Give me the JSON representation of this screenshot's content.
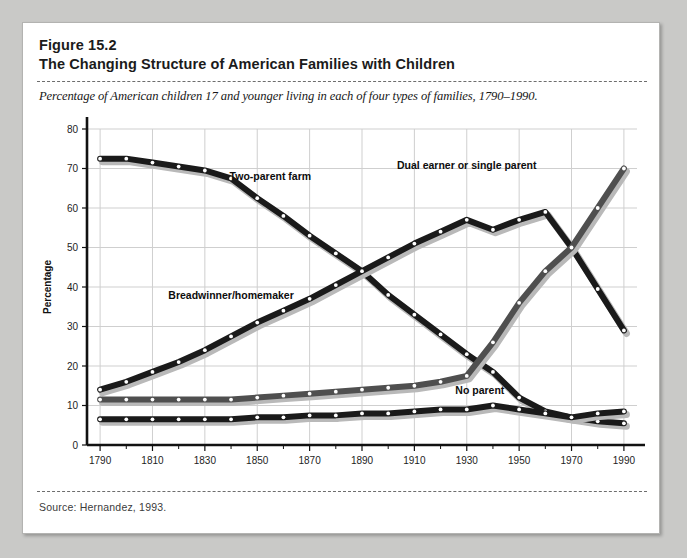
{
  "figure": {
    "number": "Figure 15.2",
    "title": "The Changing Structure of American Families with Children",
    "subtitle": "Percentage of American children 17 and younger living in each of four types of families, 1790–1990.",
    "source": "Source: Hernandez, 1993."
  },
  "colors": {
    "page_background": "#c9c9c7",
    "panel_background": "#ffffff",
    "panel_border": "#b3b3b1",
    "rule": "#6d6d6d",
    "grid": "#cfcfcf",
    "axis": "#111111",
    "series_dark": "#1a1a1a",
    "series_mid": "#4f4f4f",
    "series_shadow": "#b9b9b9",
    "marker_fill": "#ffffff"
  },
  "chart_data": {
    "type": "line",
    "title": "The Changing Structure of American Families with Children",
    "subtitle": "Percentage of American children 17 and younger living in each of four types of families, 1790–1990.",
    "xlabel": "",
    "ylabel": "Percentage",
    "xlim": [
      1785,
      1995
    ],
    "ylim": [
      0,
      80
    ],
    "yticks": [
      0,
      10,
      20,
      30,
      40,
      50,
      60,
      70,
      80
    ],
    "xticks": [
      1790,
      1810,
      1830,
      1850,
      1870,
      1890,
      1910,
      1930,
      1950,
      1970,
      1990
    ],
    "xticks_minor": [
      1800,
      1820,
      1840,
      1860,
      1880,
      1900,
      1920,
      1940,
      1960,
      1980
    ],
    "grid": true,
    "legend": "inline-labels",
    "x": [
      1790,
      1800,
      1810,
      1820,
      1830,
      1840,
      1850,
      1860,
      1870,
      1880,
      1890,
      1900,
      1910,
      1920,
      1930,
      1940,
      1950,
      1960,
      1970,
      1980,
      1990
    ],
    "series": [
      {
        "name": "Two-parent farm",
        "label": "Two-parent farm",
        "style": "dark",
        "values": [
          72.5,
          72.5,
          71.5,
          70.5,
          69.5,
          67.5,
          62.5,
          58.0,
          53.0,
          48.5,
          44.0,
          38.0,
          33.0,
          28.0,
          23.0,
          18.5,
          12.0,
          8.5,
          7.0,
          6.0,
          5.5
        ]
      },
      {
        "name": "Breadwinner/homemaker",
        "label": "Breadwinner/homemaker",
        "style": "dark",
        "values": [
          14.0,
          16.0,
          18.5,
          21.0,
          24.0,
          27.5,
          31.0,
          34.0,
          37.0,
          40.5,
          44.0,
          47.5,
          51.0,
          54.0,
          57.0,
          54.5,
          57.0,
          59.0,
          50.0,
          39.5,
          29.0
        ]
      },
      {
        "name": "Dual earner or single parent",
        "label": "Dual earner or single parent",
        "style": "mid",
        "values": [
          11.5,
          11.5,
          11.5,
          11.5,
          11.5,
          11.5,
          12.0,
          12.5,
          13.0,
          13.5,
          14.0,
          14.5,
          15.0,
          16.0,
          17.5,
          26.0,
          36.0,
          44.0,
          50.0,
          60.0,
          70.0
        ]
      },
      {
        "name": "No parent",
        "label": "No parent",
        "style": "dark",
        "values": [
          6.5,
          6.5,
          6.5,
          6.5,
          6.5,
          6.5,
          7.0,
          7.0,
          7.5,
          7.5,
          8.0,
          8.0,
          8.5,
          9.0,
          9.0,
          10.0,
          9.0,
          8.0,
          7.0,
          8.0,
          8.5
        ]
      }
    ],
    "annotations": [
      {
        "text": "Two-parent farm",
        "x": 1855,
        "y": 67
      },
      {
        "text": "Breadwinner/homemaker",
        "x": 1840,
        "y": 37
      },
      {
        "text": "Dual earner or single parent",
        "x": 1930,
        "y": 70
      },
      {
        "text": "No parent",
        "x": 1935,
        "y": 13
      }
    ]
  }
}
